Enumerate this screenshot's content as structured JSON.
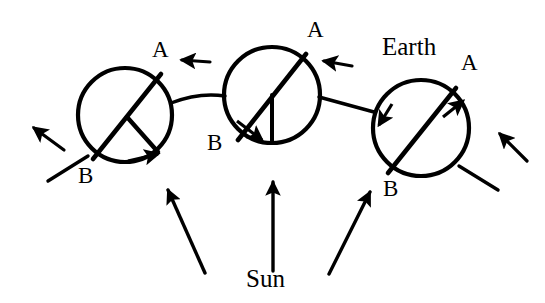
{
  "figure": {
    "type": "astronomy-diagram",
    "background_color": "#ffffff",
    "ink_color": "#000000",
    "width": 545,
    "height": 303
  },
  "labels": {
    "sun": "Sun",
    "earth": "Earth",
    "axis_north": "A",
    "axis_south": "B"
  },
  "earth_positions": [
    {
      "id": "earth-left",
      "name": "earth-position-left",
      "center": [
        125,
        115
      ],
      "radius": 47,
      "axis_top_label": "A",
      "axis_top_label_pos": [
        152,
        38
      ],
      "axis_bottom_label": "B",
      "axis_bottom_label_pos": [
        78,
        164
      ],
      "axis_end_a": [
        161,
        74
      ],
      "axis_end_b": [
        93,
        159
      ],
      "has_equator_line": true,
      "rotation_arrow": "clockwise-lower-right"
    },
    {
      "id": "earth-middle",
      "name": "earth-position-middle",
      "center": [
        272,
        95
      ],
      "radius": 48,
      "axis_top_label": "A",
      "axis_top_label_pos": [
        307,
        18
      ],
      "axis_bottom_label": "B",
      "axis_bottom_label_pos": [
        207,
        131
      ],
      "axis_end_a": [
        306,
        54
      ],
      "axis_end_b": [
        238,
        140
      ],
      "has_equator_line": true,
      "rotation_arrow": "lower-left"
    },
    {
      "id": "earth-right",
      "name": "earth-position-right",
      "center": [
        421,
        128
      ],
      "radius": 48,
      "axis_top_label": "A",
      "axis_top_label_pos": [
        461,
        51
      ],
      "axis_bottom_label": "B",
      "axis_bottom_label_pos": [
        383,
        177
      ],
      "axis_end_a": [
        456,
        88
      ],
      "axis_end_b": [
        388,
        173
      ],
      "has_equator_line": false,
      "rotation_arrow": "two-arrowheads-on-rim"
    }
  ],
  "sun_rays": [
    {
      "name": "sun-ray-left",
      "from": [
        205,
        275
      ],
      "to": [
        166,
        188
      ],
      "direction": "up-left"
    },
    {
      "name": "sun-ray-center",
      "from": [
        273,
        272
      ],
      "to": [
        273,
        180
      ],
      "direction": "up"
    },
    {
      "name": "sun-ray-right",
      "from": [
        330,
        275
      ],
      "to": [
        372,
        190
      ],
      "direction": "up-right"
    }
  ],
  "orbit_arrows": [
    {
      "name": "orbit-arrow-far-left",
      "direction": "up-left",
      "tip": [
        30,
        127
      ]
    },
    {
      "name": "orbit-arrow-between-left-middle",
      "direction": "left",
      "tip": [
        184,
        60
      ]
    },
    {
      "name": "orbit-arrow-between-middle-right",
      "direction": "left",
      "tip": [
        325,
        62
      ]
    },
    {
      "name": "orbit-arrow-far-right",
      "direction": "up-left",
      "tip": [
        498,
        133
      ]
    }
  ],
  "orbit_path": {
    "name": "orbit-path",
    "description": "curved orbital track passing through the three Earth positions"
  }
}
